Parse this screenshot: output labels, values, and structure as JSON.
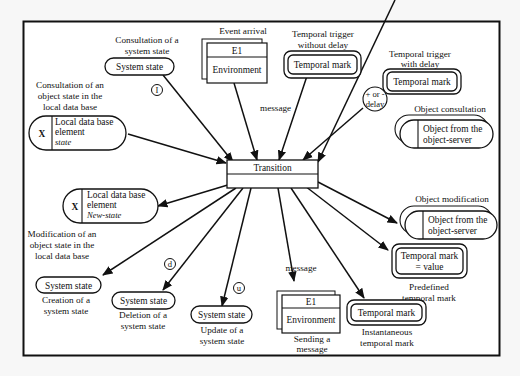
{
  "diagram": {
    "center": {
      "label": "Transition"
    },
    "nodes": {
      "consult_system_state": {
        "caption": [
          "Consultation of a",
          "system state"
        ],
        "box": "System state",
        "badge": "I"
      },
      "event_arrival": {
        "caption": "Event arrival",
        "top": "E1",
        "bottom": "Environment",
        "edge_label": "message"
      },
      "trigger_no_delay": {
        "caption": [
          "Temporal trigger",
          "without delay"
        ],
        "box": "Temporal mark"
      },
      "trigger_delay": {
        "caption": [
          "Temporal trigger",
          "with delay"
        ],
        "box": "Temporal mark",
        "delay_badge": [
          "+ or -",
          "delay"
        ]
      },
      "object_consultation": {
        "caption": "Object consultation",
        "box": [
          "Object from the",
          "object-server"
        ]
      },
      "consult_object_state": {
        "caption": [
          "Consultation of an",
          "object state in the",
          "local data base"
        ],
        "marker": "X",
        "box": [
          "Local data base",
          "element"
        ],
        "sub": "state"
      },
      "modify_object_state": {
        "caption": [
          "Modification of an",
          "object state in the",
          "local data base"
        ],
        "marker": "X",
        "box": [
          "Local data base",
          "element"
        ],
        "sub": "New-state"
      },
      "object_modification": {
        "caption": "Object modification",
        "box": [
          "Object from the",
          "object-server"
        ]
      },
      "predefined_mark": {
        "caption": [
          "Predefined",
          "temporal mark"
        ],
        "box": [
          "Temporal mark",
          "= value"
        ]
      },
      "create_state": {
        "caption": [
          "Creation of a",
          "system state"
        ],
        "box": "System state"
      },
      "delete_state": {
        "caption": [
          "Deletion of a",
          "system state"
        ],
        "box": "System state",
        "badge": "d"
      },
      "update_state": {
        "caption": [
          "Update of a",
          "system state"
        ],
        "box": "System state",
        "badge": "u"
      },
      "send_message": {
        "caption": [
          "Sending a",
          "message"
        ],
        "top": "E1",
        "bottom": "Environment",
        "edge_label": "message"
      },
      "instant_mark": {
        "caption": [
          "Instantaneous",
          "temporal mark"
        ],
        "box": "Temporal mark"
      }
    }
  }
}
